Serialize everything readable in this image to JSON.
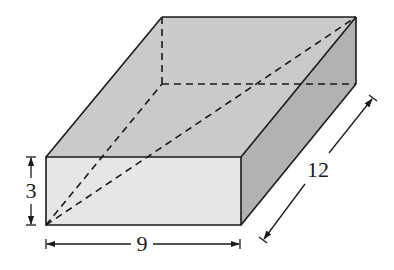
{
  "diagram": {
    "type": "rectangular-prism",
    "colors": {
      "top_face": "#cacaca",
      "front_face": "#e6e6e6",
      "right_face": "#b2b2b2",
      "edge": "#1a1a1a",
      "hidden_edge": "#1a1a1a",
      "background": "#ffffff"
    },
    "vertices": {
      "front_top_left": [
        46,
        157
      ],
      "front_top_right": [
        241,
        157
      ],
      "front_bottom_left": [
        46,
        225
      ],
      "front_bottom_right": [
        241,
        225
      ],
      "back_top_left": [
        162,
        17
      ],
      "back_top_right": [
        356,
        17
      ],
      "back_bottom_left": [
        162,
        84
      ],
      "back_bottom_right": [
        356,
        84
      ]
    },
    "dimensions": {
      "height": {
        "label": "3",
        "value": 3
      },
      "width": {
        "label": "9",
        "value": 9
      },
      "depth": {
        "label": "12",
        "value": 12
      }
    },
    "hidden_lines": [
      {
        "name": "back-vertical-edge",
        "from": "back_top_left",
        "to": "back_bottom_left"
      },
      {
        "name": "back-bottom-edge",
        "from": "back_bottom_left",
        "to": "back_bottom_right"
      },
      {
        "name": "base-diagonal",
        "from": "front_bottom_left",
        "to": "back_bottom_left"
      },
      {
        "name": "space-diagonal",
        "from": "front_bottom_left",
        "to": "back_top_right"
      }
    ]
  }
}
